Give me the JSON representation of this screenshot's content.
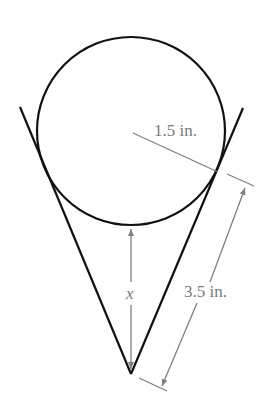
{
  "diagram": {
    "labels": {
      "radius": "1.5 in.",
      "slant": "3.5 in.",
      "height_var": "x"
    },
    "colors": {
      "shape_stroke": "#111111",
      "dimension_stroke": "#808080",
      "label": "#7a7a7a"
    }
  }
}
